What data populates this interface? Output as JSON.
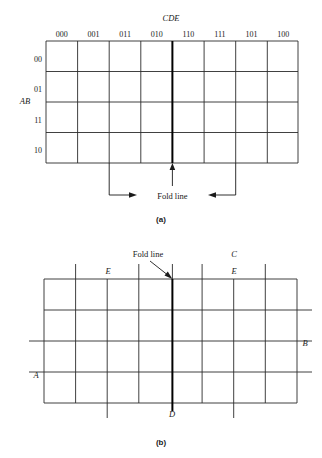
{
  "figure": {
    "panel_a": {
      "caption": "(a)",
      "top_label": "CDE",
      "side_label": "AB",
      "col_headers": [
        "000",
        "001",
        "011",
        "010",
        "110",
        "111",
        "101",
        "100"
      ],
      "row_headers": [
        "00",
        "01",
        "11",
        "10"
      ],
      "fold_label": "Fold line",
      "grid": {
        "cols": 8,
        "rows": 4
      }
    },
    "panel_b": {
      "caption": "(b)",
      "fold_label": "Fold line",
      "var_labels": {
        "e_left": "E",
        "c_top": "C",
        "e_right": "E",
        "b_right": "B",
        "a_left": "A",
        "d_bottom": "D"
      },
      "grid": {
        "cols": 8,
        "rows": 4
      }
    },
    "colors": {
      "line": "#1a1a1a",
      "grid_line": "#2b2b2b",
      "background": "#ffffff"
    }
  }
}
